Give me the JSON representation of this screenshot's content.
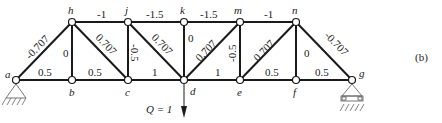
{
  "figure": {
    "panel_label": "(b)",
    "load_label": "Q = 1",
    "nodes": {
      "a": "a",
      "b": "b",
      "c": "c",
      "d": "d",
      "e": "e",
      "f": "f",
      "g": "g",
      "h": "h",
      "j": "j",
      "k": "k",
      "m": "m",
      "n": "n"
    },
    "member_forces": {
      "ah": "-0.707",
      "ab": "0.5",
      "hb": "0",
      "hc": "0.707",
      "bc": "0.5",
      "hj": "-1",
      "jc": "-0.5",
      "jd": "0.707",
      "jk": "-1.5",
      "cd": "1",
      "kd": "0",
      "km": "-1.5",
      "dm": "0.707",
      "de": "1",
      "me": "-0.5",
      "mn": "-1",
      "en": "0.707",
      "ef": "0.5",
      "nf": "0",
      "ng": "-0.707",
      "fg": "0.5"
    }
  }
}
